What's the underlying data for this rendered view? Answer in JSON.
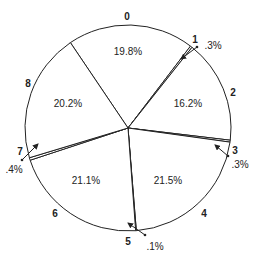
{
  "chart_data": {
    "type": "pie",
    "title": "",
    "start_angle_deg": -34,
    "direction": "clockwise",
    "categories": [
      "0",
      "1",
      "2",
      "3",
      "4",
      "5",
      "6",
      "7",
      "8"
    ],
    "values": [
      19.8,
      0.3,
      16.2,
      0.3,
      21.5,
      0.1,
      21.1,
      0.4,
      20.2
    ],
    "value_labels": [
      "19.8%",
      ".3%",
      "16.2%",
      ".3%",
      "21.5%",
      ".1%",
      "21.1%",
      ".4%",
      "20.2%"
    ],
    "fill_color": "#ffffff",
    "stroke_color": "#222222",
    "legend": "none",
    "category_label_positions": [
      {
        "x": 127,
        "y": 17
      },
      {
        "x": 195,
        "y": 40
      },
      {
        "x": 233,
        "y": 93
      },
      {
        "x": 235,
        "y": 151
      },
      {
        "x": 204,
        "y": 214
      },
      {
        "x": 128,
        "y": 242
      },
      {
        "x": 55,
        "y": 214
      },
      {
        "x": 20,
        "y": 152
      },
      {
        "x": 28,
        "y": 84
      }
    ],
    "value_label_positions": [
      {
        "x": 128,
        "y": 52,
        "arrow": null
      },
      {
        "x": 213,
        "y": 46,
        "arrow": {
          "from": [
            197,
            47
          ],
          "to": [
            181,
            59
          ]
        }
      },
      {
        "x": 188,
        "y": 104,
        "arrow": null
      },
      {
        "x": 240,
        "y": 165,
        "arrow": {
          "from": [
            228,
            156
          ],
          "to": [
            215,
            145
          ]
        }
      },
      {
        "x": 168,
        "y": 181,
        "arrow": null
      },
      {
        "x": 155,
        "y": 247,
        "arrow": {
          "from": [
            145,
            235
          ],
          "to": [
            128,
            223
          ]
        }
      },
      {
        "x": 86,
        "y": 181,
        "arrow": null
      },
      {
        "x": 14,
        "y": 170,
        "arrow": {
          "from": [
            22,
            160
          ],
          "to": [
            38,
            144
          ]
        }
      },
      {
        "x": 68,
        "y": 104,
        "arrow": null
      }
    ],
    "center": [
      128,
      128
    ],
    "radius": 103
  }
}
